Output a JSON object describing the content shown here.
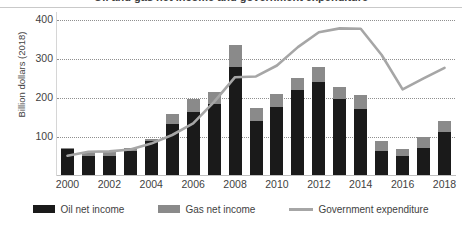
{
  "chart": {
    "title_cropped": "Oil and gas net income and government expenditure",
    "y_axis_title": "Billion dollars (2018)",
    "y_ticks": [
      "100",
      "200",
      "300",
      "400"
    ],
    "x_ticks": [
      "2000",
      "2002",
      "2004",
      "2006",
      "2008",
      "2010",
      "2012",
      "2014",
      "2016",
      "2018"
    ],
    "legend": [
      {
        "label": "Oil net income",
        "marker": "bar-swatch-black",
        "color": "#1a1a1a"
      },
      {
        "label": "Gas net income",
        "marker": "bar-swatch-gray",
        "color": "#8a8a8a"
      },
      {
        "label": "Government expenditure",
        "marker": "line-swatch-gray",
        "color": "#a6a6a6"
      }
    ]
  },
  "chart_data": {
    "type": "bar",
    "title": "Oil and gas net income and government expenditure",
    "xlabel": "",
    "ylabel": "Billion dollars (2018)",
    "ylim": [
      0,
      420
    ],
    "grid": true,
    "gridlines": [
      100,
      200,
      300,
      400
    ],
    "legend_position": "bottom",
    "stacked": true,
    "categories": [
      "2000",
      "2001",
      "2002",
      "2003",
      "2004",
      "2005",
      "2006",
      "2007",
      "2008",
      "2009",
      "2010",
      "2011",
      "2012",
      "2013",
      "2014",
      "2015",
      "2016",
      "2017",
      "2018"
    ],
    "tick_labels": [
      "2000",
      "2002",
      "2004",
      "2006",
      "2008",
      "2010",
      "2012",
      "2014",
      "2016",
      "2018"
    ],
    "series": [
      {
        "name": "Oil net income",
        "type": "bar",
        "color": "#1a1a1a",
        "values": [
          68,
          50,
          52,
          65,
          90,
          132,
          165,
          185,
          280,
          140,
          178,
          220,
          240,
          197,
          172,
          65,
          50,
          73,
          113
        ]
      },
      {
        "name": "Gas net income",
        "type": "bar",
        "color": "#8a8a8a",
        "values": [
          5,
          12,
          10,
          7,
          5,
          28,
          33,
          30,
          55,
          35,
          32,
          32,
          40,
          31,
          35,
          25,
          18,
          27,
          27
        ]
      },
      {
        "name": "Government expenditure",
        "type": "line",
        "color": "#a6a6a6",
        "values": [
          52,
          62,
          63,
          68,
          83,
          105,
          135,
          190,
          253,
          255,
          283,
          330,
          368,
          378,
          377,
          310,
          222,
          250,
          277
        ]
      }
    ],
    "totals": [
      73,
      62,
      62,
      72,
      95,
      160,
      198,
      215,
      335,
      175,
      210,
      252,
      280,
      228,
      207,
      90,
      68,
      100,
      140
    ]
  }
}
